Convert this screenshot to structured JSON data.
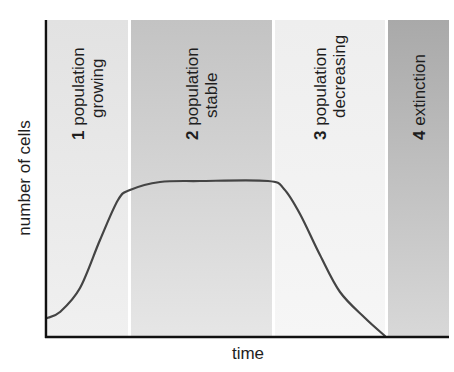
{
  "chart_data": {
    "type": "line",
    "title": "",
    "xlabel": "time",
    "ylabel": "number of cells",
    "phases": [
      {
        "number": "1",
        "line1": "population",
        "line2": "growing",
        "x_start": 48,
        "x_end": 128,
        "color_top": "#e2e2e2",
        "color_bottom": "#f0f0f0"
      },
      {
        "number": "2",
        "line1": "population",
        "line2": "stable",
        "x_start": 131,
        "x_end": 272,
        "color_top": "#c3c3c3",
        "color_bottom": "#e6e6e6"
      },
      {
        "number": "3",
        "line1": "population",
        "line2": "decreasing",
        "x_start": 275,
        "x_end": 385,
        "color_top": "#eeeeee",
        "color_bottom": "#f6f6f6"
      },
      {
        "number": "4",
        "line1": "extinction",
        "line2": "",
        "x_start": 388,
        "x_end": 449,
        "color_top": "#a9a9a9",
        "color_bottom": "#d8d8d8"
      }
    ],
    "curve_points": [
      [
        47,
        318
      ],
      [
        60,
        312
      ],
      [
        80,
        288
      ],
      [
        100,
        240
      ],
      [
        118,
        200
      ],
      [
        130,
        190
      ],
      [
        160,
        182
      ],
      [
        200,
        181
      ],
      [
        268,
        181
      ],
      [
        284,
        189
      ],
      [
        300,
        214
      ],
      [
        320,
        255
      ],
      [
        340,
        292
      ],
      [
        365,
        318
      ],
      [
        385,
        336
      ]
    ],
    "grid": false,
    "legend": null
  }
}
